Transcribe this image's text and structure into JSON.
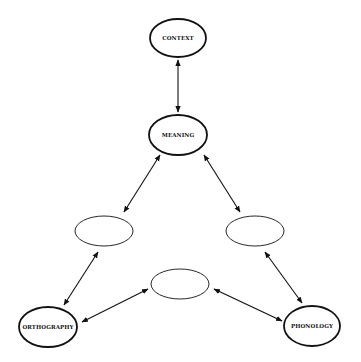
{
  "diagram": {
    "nodes": [
      {
        "id": "context",
        "label": "CONTEXT",
        "cx": 178,
        "cy": 38,
        "rx": 28,
        "ry": 19,
        "bold": true
      },
      {
        "id": "meaning",
        "label": "MEANING",
        "cx": 178,
        "cy": 135,
        "rx": 29,
        "ry": 20,
        "bold": true
      },
      {
        "id": "left-empty",
        "label": "",
        "cx": 104,
        "cy": 231,
        "rx": 29,
        "ry": 15,
        "bold": false
      },
      {
        "id": "right-empty",
        "label": "",
        "cx": 255,
        "cy": 231,
        "rx": 29,
        "ry": 15,
        "bold": false
      },
      {
        "id": "middle-empty",
        "label": "",
        "cx": 180,
        "cy": 284,
        "rx": 29,
        "ry": 15,
        "bold": false
      },
      {
        "id": "orthography",
        "label": "ORTHOGRAPHY",
        "cx": 48,
        "cy": 327,
        "rx": 29,
        "ry": 20,
        "bold": true
      },
      {
        "id": "phonology",
        "label": "PHONOLOGY",
        "cx": 312,
        "cy": 326,
        "rx": 28,
        "ry": 20,
        "bold": true
      }
    ],
    "edges": [
      {
        "from": "context",
        "to": "meaning",
        "x1": 178,
        "y1": 60,
        "x2": 178,
        "y2": 112
      },
      {
        "from": "meaning",
        "to": "left-empty",
        "x1": 160,
        "y1": 155,
        "x2": 124,
        "y2": 212
      },
      {
        "from": "meaning",
        "to": "right-empty",
        "x1": 204,
        "y1": 155,
        "x2": 240,
        "y2": 212
      },
      {
        "from": "left-empty",
        "to": "orthography",
        "x1": 98,
        "y1": 252,
        "x2": 64,
        "y2": 305
      },
      {
        "from": "right-empty",
        "to": "phonology",
        "x1": 265,
        "y1": 252,
        "x2": 302,
        "y2": 303
      },
      {
        "from": "middle-empty",
        "to": "orthography",
        "x1": 148,
        "y1": 289,
        "x2": 82,
        "y2": 322
      },
      {
        "from": "middle-empty",
        "to": "phonology",
        "x1": 214,
        "y1": 289,
        "x2": 282,
        "y2": 321
      }
    ]
  }
}
